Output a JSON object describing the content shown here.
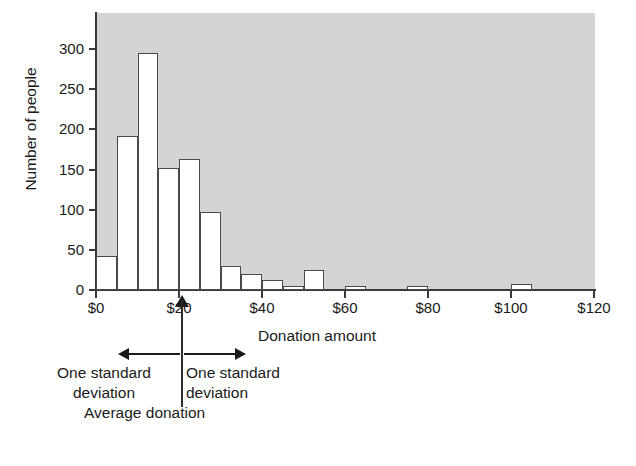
{
  "chart_data": {
    "type": "bar",
    "title": "",
    "subtitle": "",
    "xlabel": "Donation amount",
    "ylabel": "Number of people",
    "bin_width": 5,
    "bin_unit": "$",
    "xlim": [
      0,
      120
    ],
    "ylim": [
      0,
      330
    ],
    "grid": false,
    "legend": false,
    "plot_background_color": "#d4d4d4",
    "bar_fill_color": "#ffffff",
    "bar_edge_color": "#4a4a4a",
    "x_tick_labels": [
      "$0",
      "$20",
      "$40",
      "$60",
      "$80",
      "$100",
      "$120"
    ],
    "x_tick_values": [
      0,
      20,
      40,
      60,
      80,
      100,
      120
    ],
    "y_tick_labels": [
      "0",
      "50",
      "100",
      "150",
      "200",
      "250",
      "300"
    ],
    "y_tick_values": [
      0,
      50,
      100,
      150,
      200,
      250,
      300
    ],
    "categories": [
      "$0-5",
      "$5-10",
      "$10-15",
      "$15-20",
      "$20-25",
      "$25-30",
      "$30-35",
      "$35-40",
      "$40-45",
      "$45-50",
      "$50-55",
      "$55-60",
      "$60-65",
      "$65-70",
      "$70-75",
      "$75-80",
      "$80-85",
      "$85-90",
      "$90-95",
      "$95-100",
      "$100-105"
    ],
    "bin_starts": [
      0,
      5,
      10,
      15,
      20,
      25,
      30,
      35,
      40,
      45,
      50,
      55,
      60,
      65,
      70,
      75,
      80,
      85,
      90,
      95,
      100
    ],
    "values": [
      42,
      192,
      295,
      152,
      163,
      97,
      30,
      20,
      12,
      5,
      25,
      0,
      5,
      0,
      0,
      5,
      0,
      0,
      0,
      0,
      8
    ],
    "annotations": {
      "average_marker_label": "Average donation",
      "average_marker_value": 18,
      "std_dev_left_label": "One standard\ndeviation",
      "std_dev_right_label": "One standard\ndeviation",
      "std_dev_left_line1": "One standard",
      "std_dev_left_line2": "deviation",
      "std_dev_right_line1": "One standard",
      "std_dev_right_line2": "deviation"
    }
  }
}
